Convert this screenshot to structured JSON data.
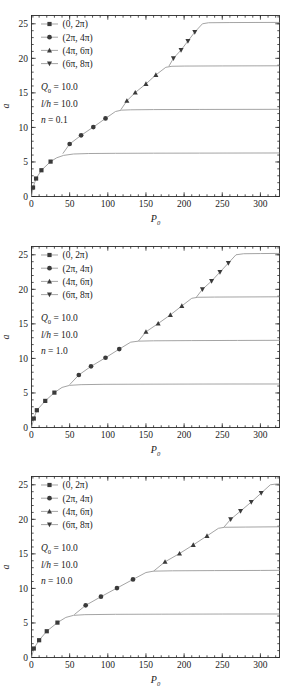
{
  "figure": {
    "panel_count": 3,
    "colors": {
      "curve": "#9a9a9a",
      "marker": "#3a3a3a",
      "axis": "#2b2b2b",
      "background": "#ffffff"
    }
  },
  "chart_data": [
    {
      "type": "line",
      "title": "",
      "xlabel": "P0",
      "xlabel_display": "P",
      "xlabel_sub": "0",
      "ylabel": "a",
      "xlim": [
        0,
        325
      ],
      "ylim": [
        0,
        26.2
      ],
      "xticks": [
        0,
        50,
        100,
        150,
        200,
        250,
        300
      ],
      "yticks": [
        0,
        5,
        10,
        15,
        20,
        25
      ],
      "xminor_step": 10,
      "yminor_step": 1,
      "grid": false,
      "legend_position": "upper-left",
      "annotations": [
        "Q0 = 10.0",
        "l/h = 10.0",
        "n = 0.1"
      ],
      "annotation_parts": [
        {
          "sym": "Q",
          "sub": "0",
          "rest": "= 10.0"
        },
        {
          "sym": "l/h",
          "sub": "",
          "rest": "= 10.0"
        },
        {
          "sym": "n",
          "sub": "",
          "rest": "= 0.1"
        }
      ],
      "series": [
        {
          "name": "(0, 2π)",
          "marker": "square",
          "points": [
            [
              2,
              1.3
            ],
            [
              6,
              2.6
            ],
            [
              13,
              3.8
            ],
            [
              25,
              5.05
            ]
          ],
          "line": [
            [
              0,
              0
            ],
            [
              2,
              1.3
            ],
            [
              6,
              2.6
            ],
            [
              13,
              3.8
            ],
            [
              25,
              5.05
            ],
            [
              33,
              5.6
            ],
            [
              42,
              5.95
            ],
            [
              55,
              6.15
            ],
            [
              75,
              6.22
            ],
            [
              110,
              6.25
            ],
            [
              160,
              6.27
            ],
            [
              220,
              6.28
            ],
            [
              325,
              6.3
            ]
          ]
        },
        {
          "name": "(2π, 4π)",
          "marker": "circle",
          "points": [
            [
              50,
              7.6
            ],
            [
              65,
              8.85
            ],
            [
              81,
              10.05
            ],
            [
              97,
              11.3
            ]
          ],
          "line": [
            [
              41,
              6.2
            ],
            [
              50,
              7.6
            ],
            [
              65,
              8.85
            ],
            [
              81,
              10.05
            ],
            [
              97,
              11.3
            ],
            [
              110,
              12.3
            ],
            [
              118,
              12.5
            ],
            [
              130,
              12.55
            ],
            [
              160,
              12.58
            ],
            [
              220,
              12.6
            ],
            [
              325,
              12.62
            ]
          ]
        },
        {
          "name": "(4π, 6π)",
          "marker": "triangle-up",
          "points": [
            [
              125,
              13.85
            ],
            [
              136,
              15.05
            ],
            [
              150,
              16.3
            ],
            [
              163,
              17.6
            ]
          ],
          "line": [
            [
              117,
              12.55
            ],
            [
              125,
              13.85
            ],
            [
              136,
              15.05
            ],
            [
              150,
              16.3
            ],
            [
              163,
              17.6
            ],
            [
              176,
              18.7
            ],
            [
              184,
              18.85
            ],
            [
              200,
              18.88
            ],
            [
              250,
              18.9
            ],
            [
              325,
              18.92
            ]
          ]
        },
        {
          "name": "(6π, 8π)",
          "marker": "triangle-down",
          "points": [
            [
              186,
              20.0
            ],
            [
              196,
              21.2
            ],
            [
              205,
              22.5
            ],
            [
              214,
              23.8
            ]
          ],
          "line": [
            [
              180,
              18.85
            ],
            [
              186,
              20.0
            ],
            [
              196,
              21.2
            ],
            [
              205,
              22.5
            ],
            [
              214,
              23.8
            ],
            [
              224,
              25.0
            ],
            [
              232,
              25.15
            ],
            [
              260,
              25.18
            ],
            [
              325,
              25.2
            ]
          ]
        }
      ]
    },
    {
      "type": "line",
      "title": "",
      "xlabel": "P0",
      "xlabel_display": "P",
      "xlabel_sub": "0",
      "ylabel": "a",
      "xlim": [
        0,
        325
      ],
      "ylim": [
        0,
        26.2
      ],
      "xticks": [
        0,
        50,
        100,
        150,
        200,
        250,
        300
      ],
      "yticks": [
        0,
        5,
        10,
        15,
        20,
        25
      ],
      "xminor_step": 10,
      "yminor_step": 1,
      "grid": false,
      "legend_position": "upper-left",
      "annotations": [
        "Q0 = 10.0",
        "l/h = 10.0",
        "n = 1.0"
      ],
      "annotation_parts": [
        {
          "sym": "Q",
          "sub": "0",
          "rest": "= 10.0"
        },
        {
          "sym": "l/h",
          "sub": "",
          "rest": "= 10.0"
        },
        {
          "sym": "n",
          "sub": "",
          "rest": "= 1.0"
        }
      ],
      "series": [
        {
          "name": "(0, 2π)",
          "marker": "square",
          "points": [
            [
              3,
              1.3
            ],
            [
              7,
              2.5
            ],
            [
              18,
              3.85
            ],
            [
              30,
              5.05
            ]
          ],
          "line": [
            [
              0,
              0
            ],
            [
              3,
              1.3
            ],
            [
              7,
              2.5
            ],
            [
              18,
              3.85
            ],
            [
              30,
              5.05
            ],
            [
              40,
              5.8
            ],
            [
              50,
              6.1
            ],
            [
              65,
              6.2
            ],
            [
              95,
              6.25
            ],
            [
              150,
              6.27
            ],
            [
              230,
              6.29
            ],
            [
              325,
              6.3
            ]
          ]
        },
        {
          "name": "(2π, 4π)",
          "marker": "circle",
          "points": [
            [
              62,
              7.6
            ],
            [
              78,
              8.85
            ],
            [
              97,
              10.1
            ],
            [
              115,
              11.35
            ]
          ],
          "line": [
            [
              50,
              6.2
            ],
            [
              62,
              7.6
            ],
            [
              78,
              8.85
            ],
            [
              97,
              10.1
            ],
            [
              115,
              11.35
            ],
            [
              130,
              12.35
            ],
            [
              140,
              12.5
            ],
            [
              160,
              12.55
            ],
            [
              210,
              12.58
            ],
            [
              270,
              12.6
            ],
            [
              325,
              12.62
            ]
          ]
        },
        {
          "name": "(4π, 6π)",
          "marker": "triangle-up",
          "points": [
            [
              150,
              13.85
            ],
            [
              166,
              15.05
            ],
            [
              182,
              16.3
            ],
            [
              197,
              17.6
            ]
          ],
          "line": [
            [
              140,
              12.5
            ],
            [
              150,
              13.85
            ],
            [
              166,
              15.05
            ],
            [
              182,
              16.3
            ],
            [
              197,
              17.6
            ],
            [
              210,
              18.7
            ],
            [
              218,
              18.85
            ],
            [
              240,
              18.88
            ],
            [
              285,
              18.9
            ],
            [
              325,
              18.92
            ]
          ]
        },
        {
          "name": "(6π, 8π)",
          "marker": "triangle-down",
          "points": [
            [
              224,
              20.0
            ],
            [
              236,
              21.2
            ],
            [
              247,
              22.5
            ],
            [
              258,
              23.8
            ]
          ],
          "line": [
            [
              216,
              18.85
            ],
            [
              224,
              20.0
            ],
            [
              236,
              21.2
            ],
            [
              247,
              22.5
            ],
            [
              258,
              23.8
            ],
            [
              268,
              25.0
            ],
            [
              278,
              25.15
            ],
            [
              300,
              25.18
            ],
            [
              325,
              25.2
            ]
          ]
        }
      ]
    },
    {
      "type": "line",
      "title": "",
      "xlabel": "P0",
      "xlabel_display": "P",
      "xlabel_sub": "0",
      "ylabel": "a",
      "xlim": [
        0,
        325
      ],
      "ylim": [
        0,
        26.2
      ],
      "xticks": [
        0,
        50,
        100,
        150,
        200,
        250,
        300
      ],
      "yticks": [
        0,
        5,
        10,
        15,
        20,
        25
      ],
      "xminor_step": 10,
      "yminor_step": 1,
      "grid": false,
      "legend_position": "upper-left",
      "annotations": [
        "Q0 = 10.0",
        "l/h = 10.0",
        "n = 10.0"
      ],
      "annotation_parts": [
        {
          "sym": "Q",
          "sub": "0",
          "rest": "= 10.0"
        },
        {
          "sym": "l/h",
          "sub": "",
          "rest": "= 10.0"
        },
        {
          "sym": "n",
          "sub": "",
          "rest": "= 10.0"
        }
      ],
      "series": [
        {
          "name": "(0, 2π)",
          "marker": "square",
          "points": [
            [
              3,
              1.3
            ],
            [
              10,
              2.5
            ],
            [
              20,
              3.8
            ],
            [
              34,
              5.05
            ]
          ],
          "line": [
            [
              0,
              0
            ],
            [
              3,
              1.3
            ],
            [
              10,
              2.5
            ],
            [
              20,
              3.8
            ],
            [
              34,
              5.05
            ],
            [
              45,
              5.8
            ],
            [
              55,
              6.1
            ],
            [
              70,
              6.2
            ],
            [
              110,
              6.25
            ],
            [
              170,
              6.27
            ],
            [
              250,
              6.29
            ],
            [
              325,
              6.3
            ]
          ]
        },
        {
          "name": "(2π, 4π)",
          "marker": "circle",
          "points": [
            [
              71,
              7.55
            ],
            [
              91,
              8.8
            ],
            [
              112,
              10.05
            ],
            [
              133,
              11.3
            ]
          ],
          "line": [
            [
              56,
              6.2
            ],
            [
              71,
              7.55
            ],
            [
              91,
              8.8
            ],
            [
              112,
              10.05
            ],
            [
              133,
              11.3
            ],
            [
              150,
              12.3
            ],
            [
              160,
              12.5
            ],
            [
              185,
              12.55
            ],
            [
              240,
              12.58
            ],
            [
              300,
              12.6
            ],
            [
              325,
              12.62
            ]
          ]
        },
        {
          "name": "(4π, 6π)",
          "marker": "triangle-up",
          "points": [
            [
              175,
              13.85
            ],
            [
              194,
              15.05
            ],
            [
              212,
              16.3
            ],
            [
              230,
              17.6
            ]
          ],
          "line": [
            [
              160,
              12.5
            ],
            [
              175,
              13.85
            ],
            [
              194,
              15.05
            ],
            [
              212,
              16.3
            ],
            [
              230,
              17.6
            ],
            [
              245,
              18.7
            ],
            [
              253,
              18.85
            ],
            [
              280,
              18.88
            ],
            [
              325,
              18.92
            ]
          ]
        },
        {
          "name": "(6π, 8π)",
          "marker": "triangle-down",
          "points": [
            [
              261,
              20.0
            ],
            [
              274,
              21.2
            ],
            [
              288,
              22.5
            ],
            [
              301,
              23.8
            ]
          ],
          "line": [
            [
              252,
              18.85
            ],
            [
              261,
              20.0
            ],
            [
              274,
              21.2
            ],
            [
              288,
              22.5
            ],
            [
              301,
              23.8
            ],
            [
              313,
              25.0
            ],
            [
              320,
              25.1
            ],
            [
              325,
              25.12
            ]
          ]
        }
      ]
    }
  ]
}
